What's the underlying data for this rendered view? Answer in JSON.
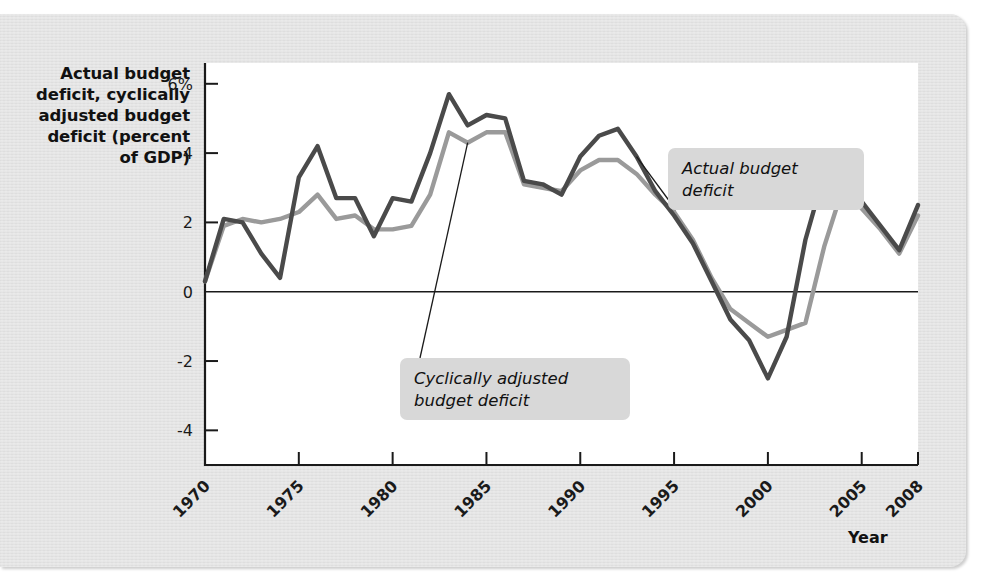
{
  "chart_data": {
    "type": "line",
    "title": "",
    "ylabel": "Actual budget deficit, cyclically adjusted budget deficit (percent of GDP)",
    "xlabel": "Year",
    "xlim": [
      1970,
      2008
    ],
    "ylim": [
      -5,
      6.6
    ],
    "grid": false,
    "legend_position": "annotations-on-plot",
    "ytick_labels": [
      "6%",
      "4",
      "2",
      "0",
      "-2",
      "-4"
    ],
    "ytick_values": [
      6,
      4,
      2,
      0,
      -2,
      -4
    ],
    "xtick_labels": [
      "1970",
      "1975",
      "1980",
      "1985",
      "1990",
      "1995",
      "2000",
      "2005",
      "2008"
    ],
    "xtick_values": [
      1970,
      1975,
      1980,
      1985,
      1990,
      1995,
      2000,
      2005,
      2008
    ],
    "x": [
      1970,
      1971,
      1972,
      1973,
      1974,
      1975,
      1976,
      1977,
      1978,
      1979,
      1980,
      1981,
      1982,
      1983,
      1984,
      1985,
      1986,
      1987,
      1988,
      1989,
      1990,
      1991,
      1992,
      1993,
      1994,
      1995,
      1996,
      1997,
      1998,
      1999,
      2000,
      2001,
      2002,
      2003,
      2004,
      2005,
      2006,
      2007,
      2008
    ],
    "series": [
      {
        "name": "Actual budget deficit",
        "color": "#4a4a4a",
        "values": [
          0.3,
          2.1,
          2.0,
          1.1,
          0.4,
          3.3,
          4.2,
          2.7,
          2.7,
          1.6,
          2.7,
          2.6,
          4.0,
          5.7,
          4.8,
          5.1,
          5.0,
          3.2,
          3.1,
          2.8,
          3.9,
          4.5,
          4.7,
          3.9,
          2.9,
          2.2,
          1.4,
          0.3,
          -0.8,
          -1.4,
          -2.5,
          -1.3,
          1.5,
          3.4,
          3.5,
          2.6,
          1.9,
          1.2,
          2.5
        ],
        "units": "percent of GDP"
      },
      {
        "name": "Cyclically adjusted budget deficit",
        "color": "#9a9a9a",
        "values": [
          0.3,
          1.9,
          2.1,
          2.0,
          2.1,
          2.3,
          2.8,
          2.1,
          2.2,
          1.8,
          1.8,
          1.9,
          2.8,
          4.6,
          4.3,
          4.6,
          4.6,
          3.1,
          3.0,
          2.9,
          3.5,
          3.8,
          3.8,
          3.4,
          2.8,
          2.3,
          1.5,
          0.4,
          -0.5,
          -0.9,
          -1.3,
          -1.1,
          -0.9,
          1.3,
          3.0,
          2.4,
          1.8,
          1.1,
          2.2
        ],
        "units": "percent of GDP"
      }
    ],
    "annotations": [
      {
        "id": "actual",
        "text_line1": "Actual budget",
        "text_line2": "deficit",
        "target_year": 1993,
        "target_value": 3.9
      },
      {
        "id": "cyclical",
        "text_line1": "Cyclically adjusted",
        "text_line2": "budget deficit",
        "target_year": 1984,
        "target_value": 4.3
      }
    ]
  },
  "axis": {
    "y_title": "Actual budget deficit, cyclically adjusted budget deficit (percent of GDP)",
    "y_title_lines": [
      "Actual budget",
      "deficit, cyclically",
      "adjusted budget",
      "deficit (percent",
      "of GDP)"
    ],
    "x_title": "Year"
  },
  "colors": {
    "paper": "#e2e2e2",
    "plot_background": "#ffffff",
    "actual_line": "#4a4a4a",
    "cyclical_line": "#9a9a9a",
    "callout_background": "#d8d8d8",
    "axis": "#1a1a1a"
  }
}
